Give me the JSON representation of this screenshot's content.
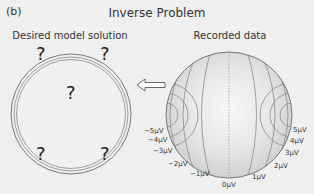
{
  "panel_label": "(b)",
  "title": "Inverse Problem",
  "left": {
    "subtitle": "Desired model solution",
    "unknown_marker": "?"
  },
  "right": {
    "subtitle": "Recorded data",
    "labels_left": [
      "−5μV",
      "−4μV",
      "−3μV",
      "−2μV",
      "−1μV"
    ],
    "label_center": "0μV",
    "labels_right": [
      "1μV",
      "2μV",
      "3μV",
      "4μV",
      "5μV"
    ]
  },
  "arrow": {
    "direction": "left"
  },
  "colors": {
    "background": "#efefef",
    "line": "#777777",
    "text": "#333333"
  }
}
